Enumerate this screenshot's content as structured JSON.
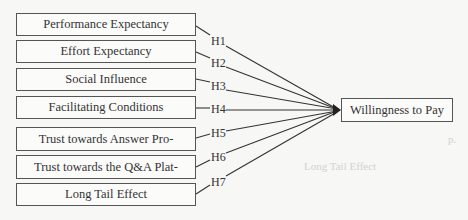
{
  "diagram": {
    "type": "research-model",
    "independent_variables": [
      {
        "id": "pe",
        "label": "Performance Expectancy",
        "hypothesis": "H1"
      },
      {
        "id": "ee",
        "label": "Effort Expectancy",
        "hypothesis": "H2"
      },
      {
        "id": "si",
        "label": "Social Influence",
        "hypothesis": "H3"
      },
      {
        "id": "fc",
        "label": "Facilitating Conditions",
        "hypothesis": "H4"
      },
      {
        "id": "tap",
        "label": "Trust towards Answer Pro-",
        "hypothesis": "H5"
      },
      {
        "id": "tqa",
        "label": "Trust towards the Q&A Plat-",
        "hypothesis": "H6"
      },
      {
        "id": "lte",
        "label": "Long Tail Effect",
        "hypothesis": "H7"
      }
    ],
    "dependent_variable": {
      "id": "wtp",
      "label": "Willingness to Pay"
    },
    "edges": [
      {
        "from": "pe",
        "to": "wtp",
        "label": "H1"
      },
      {
        "from": "ee",
        "to": "wtp",
        "label": "H2"
      },
      {
        "from": "si",
        "to": "wtp",
        "label": "H3"
      },
      {
        "from": "fc",
        "to": "wtp",
        "label": "H4"
      },
      {
        "from": "tap",
        "to": "wtp",
        "label": "H5"
      },
      {
        "from": "tqa",
        "to": "wtp",
        "label": "H6"
      },
      {
        "from": "lte",
        "to": "wtp",
        "label": "H7"
      }
    ]
  },
  "background_text": {
    "line_p": "p.",
    "heading": "Long Tail Effect"
  },
  "colors": {
    "line": "#333333",
    "box_border": "#555555",
    "background": "#f7f7f5",
    "bleed_text": "#d3d3d0"
  }
}
